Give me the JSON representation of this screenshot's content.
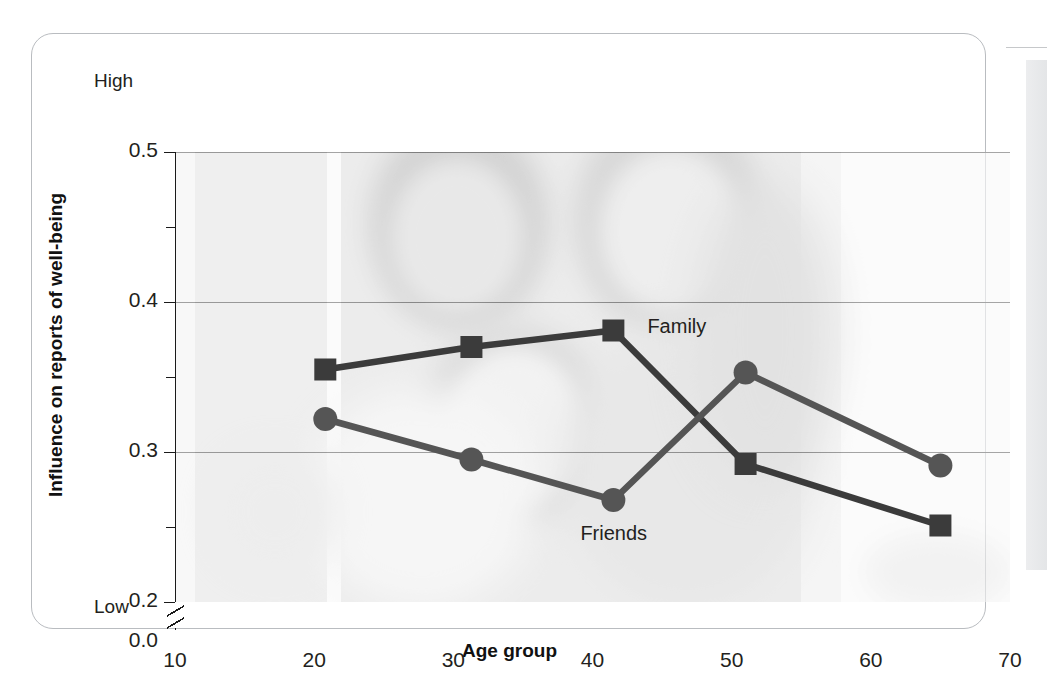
{
  "figure": {
    "axis_top_anchor": "High",
    "axis_bottom_anchor": "Low",
    "background_image_desc": "faded grayscale family photo"
  },
  "chart_data": {
    "type": "line",
    "title": "",
    "xlabel": "Age group",
    "ylabel": "Influence on reports of well-being",
    "xlim": [
      10,
      70
    ],
    "ylim": [
      0.2,
      0.5
    ],
    "y_axis_break": true,
    "y_break_label": "0.0",
    "grid": true,
    "legend": "inline-labels",
    "x_ticks": [
      "10",
      "20",
      "30",
      "40",
      "50",
      "60",
      "70"
    ],
    "x_tick_values": [
      10,
      20,
      30,
      40,
      50,
      60,
      70
    ],
    "x_minor_ticks": [
      15,
      25,
      35,
      45,
      55,
      65
    ],
    "y_ticks": [
      "0.5",
      "0.4",
      "0.3",
      "0.2",
      "0.0"
    ],
    "y_tick_values": [
      0.5,
      0.4,
      0.3,
      0.2
    ],
    "y_minor_ticks": [
      0.45,
      0.35,
      0.25
    ],
    "x": [
      20.8,
      31.3,
      41.5,
      51.0,
      65.0
    ],
    "series": [
      {
        "name": "Family",
        "marker": "square",
        "color": "#3b3b3b",
        "values": [
          0.355,
          0.37,
          0.381,
          0.292,
          0.251
        ],
        "label_x": 41.5,
        "label_y": 0.381
      },
      {
        "name": "Friends",
        "marker": "circle",
        "color": "#555555",
        "values": [
          0.322,
          0.295,
          0.268,
          0.353,
          0.291
        ],
        "label_x": 41.5,
        "label_y": 0.268
      }
    ]
  },
  "colors": {
    "frame": "#b9bcc0",
    "axis": "#1a1a1a",
    "grid": "#1a1a1a",
    "family_series": "#3b3b3b",
    "friends_series": "#555555",
    "text": "#231f20"
  }
}
